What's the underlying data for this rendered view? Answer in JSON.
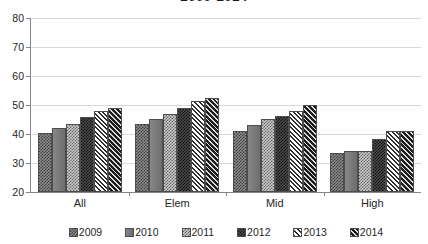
{
  "chart_data": {
    "type": "bar",
    "title": "2009-2014",
    "xlabel": "",
    "ylabel": "",
    "ylim": [
      20,
      80
    ],
    "yticks": [
      20,
      30,
      40,
      50,
      60,
      70,
      80
    ],
    "grid": true,
    "legend_position": "bottom",
    "categories": [
      "All",
      "Elem",
      "Mid",
      "High"
    ],
    "series": [
      {
        "name": "2009",
        "values": [
          40.4,
          43.5,
          41.0,
          33.4
        ]
      },
      {
        "name": "2010",
        "values": [
          42.1,
          45.2,
          43.0,
          34.1
        ]
      },
      {
        "name": "2011",
        "values": [
          43.6,
          46.9,
          45.2,
          34.3
        ]
      },
      {
        "name": "2012",
        "values": [
          45.8,
          49.0,
          46.1,
          38.2
        ]
      },
      {
        "name": "2013",
        "values": [
          48.0,
          51.3,
          47.8,
          41.0
        ]
      },
      {
        "name": "2014",
        "values": [
          49.0,
          52.3,
          50.0,
          40.9
        ]
      }
    ],
    "series_colors": [
      "#8c8c8c",
      "#7a7a7a",
      "#c9c9c9",
      "#4a4a4a",
      "#e8e8e8",
      "#2b2b2b"
    ],
    "axis_color": "#868686",
    "grid_color": "#d9d9d9",
    "text_color": "#262626"
  }
}
